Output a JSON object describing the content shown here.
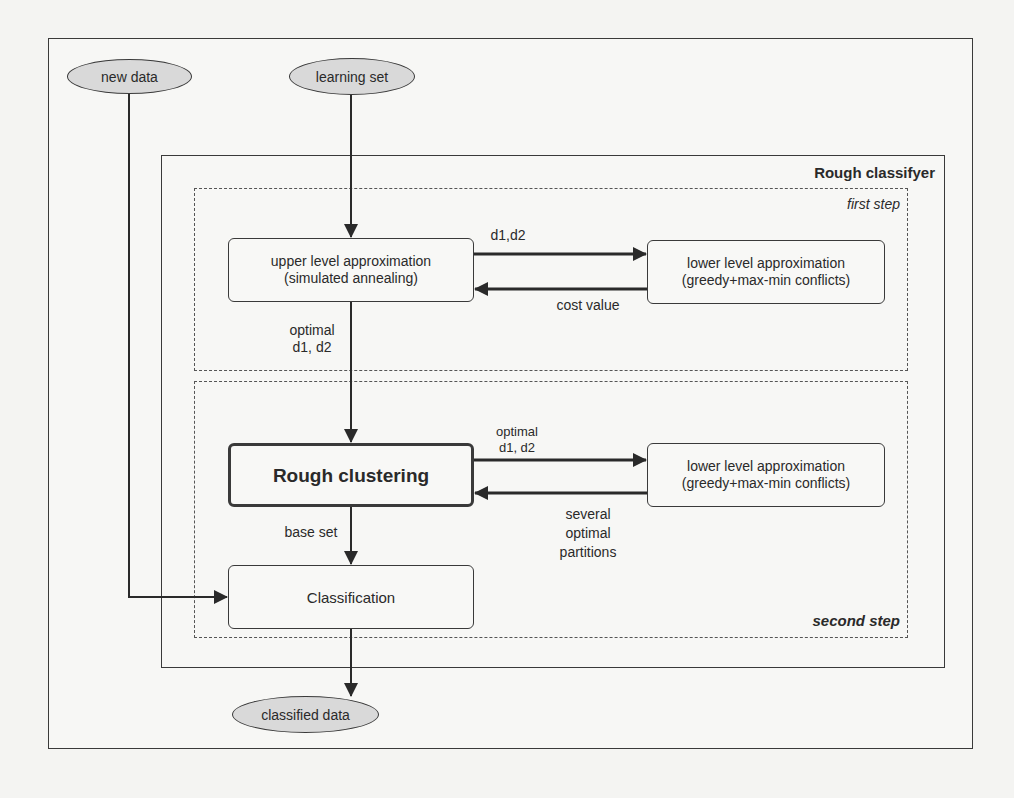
{
  "diagram": {
    "inputs": {
      "new_data": "new data",
      "learning_set": "learning set"
    },
    "output": "classified data",
    "container": {
      "title": "Rough classifyer",
      "first_step": {
        "label": "first step",
        "upper_box": [
          "upper level approximation",
          "(simulated annealing)"
        ],
        "lower_box": [
          "lower level approximation",
          "(greedy+max-min conflicts)"
        ],
        "arrow_forward_label": "d1,d2",
        "arrow_back_label": "cost value",
        "down_label": [
          "optimal",
          "d1, d2"
        ]
      },
      "second_step": {
        "label": "second step",
        "clustering_box": "Rough clustering",
        "lower_box": [
          "lower level approximation",
          "(greedy+max-min conflicts)"
        ],
        "arrow_forward_label": [
          "optimal",
          "d1, d2"
        ],
        "arrow_back_label": [
          "several",
          "optimal",
          "partitions"
        ],
        "down_label": "base set",
        "classification_box": "Classification"
      }
    }
  }
}
